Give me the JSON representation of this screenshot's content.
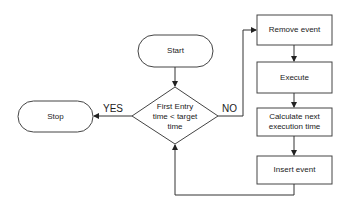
{
  "diagram": {
    "type": "flowchart",
    "nodes": {
      "start": {
        "label": "Start",
        "shape": "terminator"
      },
      "stop": {
        "label": "Stop",
        "shape": "terminator"
      },
      "decision": {
        "label": "First Entry time < target time",
        "line1": "First Entry",
        "line2": "time < target",
        "line3": "time",
        "shape": "diamond"
      },
      "remove": {
        "label": "Remove event",
        "shape": "process"
      },
      "execute": {
        "label": "Execute",
        "shape": "process"
      },
      "calculate": {
        "label": "Calculate next execution time",
        "line1": "Calculate next",
        "line2": "execution time",
        "shape": "process"
      },
      "insert": {
        "label": "Insert event",
        "shape": "process"
      }
    },
    "edges": [
      {
        "from": "start",
        "to": "decision",
        "label": ""
      },
      {
        "from": "decision",
        "to": "stop",
        "label": "YES"
      },
      {
        "from": "decision",
        "to": "remove",
        "label": "NO"
      },
      {
        "from": "remove",
        "to": "execute",
        "label": ""
      },
      {
        "from": "execute",
        "to": "calculate",
        "label": ""
      },
      {
        "from": "calculate",
        "to": "insert",
        "label": ""
      },
      {
        "from": "insert",
        "to": "decision",
        "label": ""
      }
    ],
    "edge_labels": {
      "yes": "YES",
      "no": "NO"
    },
    "colors": {
      "stroke": "#333333",
      "background": "#ffffff",
      "text": "#222222"
    }
  }
}
